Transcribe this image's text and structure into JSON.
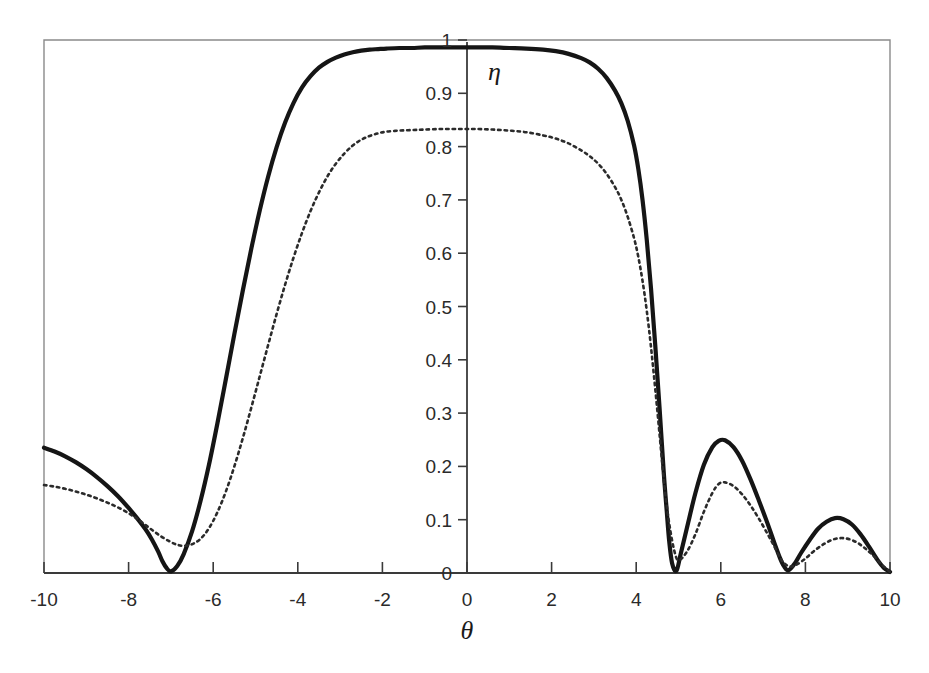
{
  "chart_data": {
    "type": "line",
    "title": "",
    "subtitle": "",
    "xlabel": "θ",
    "ylabel": "η",
    "xlim": [
      -10,
      10
    ],
    "ylim": [
      0,
      1
    ],
    "grid": false,
    "legend": "none",
    "x_ticks": [
      -10,
      -8,
      -6,
      -4,
      -2,
      0,
      2,
      4,
      6,
      8,
      10
    ],
    "x_tick_labels": [
      "-10",
      "-8",
      "-6",
      "-4",
      "-2",
      "0",
      "2",
      "4",
      "6",
      "8",
      "10"
    ],
    "y_ticks": [
      0,
      0.1,
      0.2,
      0.3,
      0.4,
      0.5,
      0.6,
      0.7,
      0.8,
      0.9,
      1
    ],
    "y_tick_labels": [
      "0",
      "0.1",
      "0.2",
      "0.3",
      "0.4",
      "0.5",
      "0.6",
      "0.7",
      "0.8",
      "0.9",
      "1"
    ],
    "y_axis_position_x": 0,
    "series": [
      {
        "name": "solid-curve",
        "style": "solid",
        "color": "#151515",
        "x": [
          -10.0,
          -9.75,
          -9.5,
          -9.25,
          -9.0,
          -8.75,
          -8.5,
          -8.25,
          -8.0,
          -7.8,
          -7.6,
          -7.45,
          -7.3,
          -7.2,
          -7.1,
          -7.0,
          -6.85,
          -6.7,
          -6.5,
          -6.3,
          -6.1,
          -5.9,
          -5.7,
          -5.5,
          -5.3,
          -5.1,
          -4.9,
          -4.7,
          -4.5,
          -4.3,
          -4.1,
          -3.9,
          -3.7,
          -3.5,
          -3.3,
          -3.1,
          -2.9,
          -2.7,
          -2.5,
          -2.3,
          -2.1,
          -1.9,
          -1.6,
          -1.3,
          -1.0,
          -0.6,
          -0.2,
          0.2,
          0.6,
          1.0,
          1.4,
          1.8,
          2.1,
          2.4,
          2.7,
          2.9,
          3.1,
          3.3,
          3.5,
          3.65,
          3.8,
          3.95,
          4.05,
          4.15,
          4.25,
          4.35,
          4.45,
          4.55,
          4.65,
          4.72,
          4.78,
          4.85,
          4.95,
          5.05,
          5.2,
          5.4,
          5.6,
          5.8,
          5.95,
          6.1,
          6.3,
          6.5,
          6.7,
          6.9,
          7.1,
          7.25,
          7.4,
          7.5,
          7.6,
          7.75,
          7.9,
          8.1,
          8.3,
          8.5,
          8.7,
          8.9,
          9.1,
          9.3,
          9.5,
          9.7,
          9.85,
          10.0
        ],
        "y": [
          0.235,
          0.228,
          0.219,
          0.208,
          0.195,
          0.18,
          0.163,
          0.144,
          0.122,
          0.103,
          0.082,
          0.063,
          0.04,
          0.022,
          0.009,
          0.003,
          0.013,
          0.035,
          0.078,
          0.135,
          0.203,
          0.281,
          0.364,
          0.448,
          0.53,
          0.608,
          0.68,
          0.744,
          0.799,
          0.845,
          0.882,
          0.911,
          0.932,
          0.948,
          0.959,
          0.967,
          0.973,
          0.977,
          0.98,
          0.982,
          0.983,
          0.984,
          0.985,
          0.985,
          0.986,
          0.986,
          0.986,
          0.986,
          0.986,
          0.985,
          0.984,
          0.982,
          0.979,
          0.974,
          0.966,
          0.958,
          0.946,
          0.929,
          0.905,
          0.881,
          0.848,
          0.802,
          0.758,
          0.7,
          0.625,
          0.534,
          0.428,
          0.312,
          0.19,
          0.118,
          0.06,
          0.018,
          0.004,
          0.035,
          0.085,
          0.15,
          0.203,
          0.236,
          0.248,
          0.249,
          0.236,
          0.211,
          0.176,
          0.136,
          0.094,
          0.06,
          0.028,
          0.012,
          0.005,
          0.018,
          0.038,
          0.062,
          0.083,
          0.096,
          0.103,
          0.101,
          0.091,
          0.073,
          0.05,
          0.025,
          0.01,
          0.002
        ]
      },
      {
        "name": "dotted-curve",
        "style": "dotted",
        "color": "#2b2b2b",
        "x": [
          -10.0,
          -9.75,
          -9.5,
          -9.25,
          -9.0,
          -8.75,
          -8.5,
          -8.25,
          -8.0,
          -7.8,
          -7.6,
          -7.4,
          -7.2,
          -7.0,
          -6.85,
          -6.7,
          -6.5,
          -6.3,
          -6.1,
          -5.9,
          -5.7,
          -5.5,
          -5.3,
          -5.1,
          -4.9,
          -4.7,
          -4.5,
          -4.3,
          -4.1,
          -3.9,
          -3.7,
          -3.5,
          -3.3,
          -3.1,
          -2.9,
          -2.7,
          -2.5,
          -2.3,
          -2.1,
          -1.9,
          -1.6,
          -1.3,
          -1.0,
          -0.6,
          -0.2,
          0.2,
          0.6,
          1.0,
          1.4,
          1.8,
          2.1,
          2.4,
          2.7,
          2.9,
          3.1,
          3.3,
          3.5,
          3.65,
          3.8,
          3.95,
          4.05,
          4.15,
          4.25,
          4.35,
          4.45,
          4.55,
          4.65,
          4.72,
          4.8,
          4.9,
          5.0,
          5.2,
          5.4,
          5.6,
          5.8,
          5.95,
          6.1,
          6.3,
          6.5,
          6.7,
          6.9,
          7.1,
          7.25,
          7.4,
          7.5,
          7.65,
          7.8,
          8.0,
          8.2,
          8.45,
          8.7,
          8.95,
          9.2,
          9.4,
          9.6,
          9.8,
          10.0
        ],
        "y": [
          0.165,
          0.162,
          0.158,
          0.153,
          0.147,
          0.14,
          0.132,
          0.123,
          0.112,
          0.102,
          0.09,
          0.078,
          0.067,
          0.058,
          0.053,
          0.051,
          0.054,
          0.064,
          0.084,
          0.114,
          0.153,
          0.2,
          0.253,
          0.31,
          0.369,
          0.428,
          0.486,
          0.541,
          0.592,
          0.638,
          0.679,
          0.714,
          0.744,
          0.768,
          0.787,
          0.802,
          0.813,
          0.82,
          0.825,
          0.828,
          0.83,
          0.831,
          0.832,
          0.833,
          0.833,
          0.833,
          0.832,
          0.83,
          0.827,
          0.821,
          0.815,
          0.806,
          0.793,
          0.782,
          0.768,
          0.749,
          0.724,
          0.7,
          0.668,
          0.628,
          0.593,
          0.548,
          0.492,
          0.424,
          0.346,
          0.262,
          0.177,
          0.128,
          0.083,
          0.042,
          0.024,
          0.04,
          0.073,
          0.115,
          0.15,
          0.167,
          0.17,
          0.163,
          0.148,
          0.127,
          0.102,
          0.074,
          0.052,
          0.029,
          0.018,
          0.012,
          0.016,
          0.027,
          0.041,
          0.055,
          0.064,
          0.065,
          0.058,
          0.047,
          0.033,
          0.016,
          0.002
        ]
      }
    ]
  },
  "axes": {
    "x_axis_label": "θ",
    "y_axis_label": "η"
  }
}
